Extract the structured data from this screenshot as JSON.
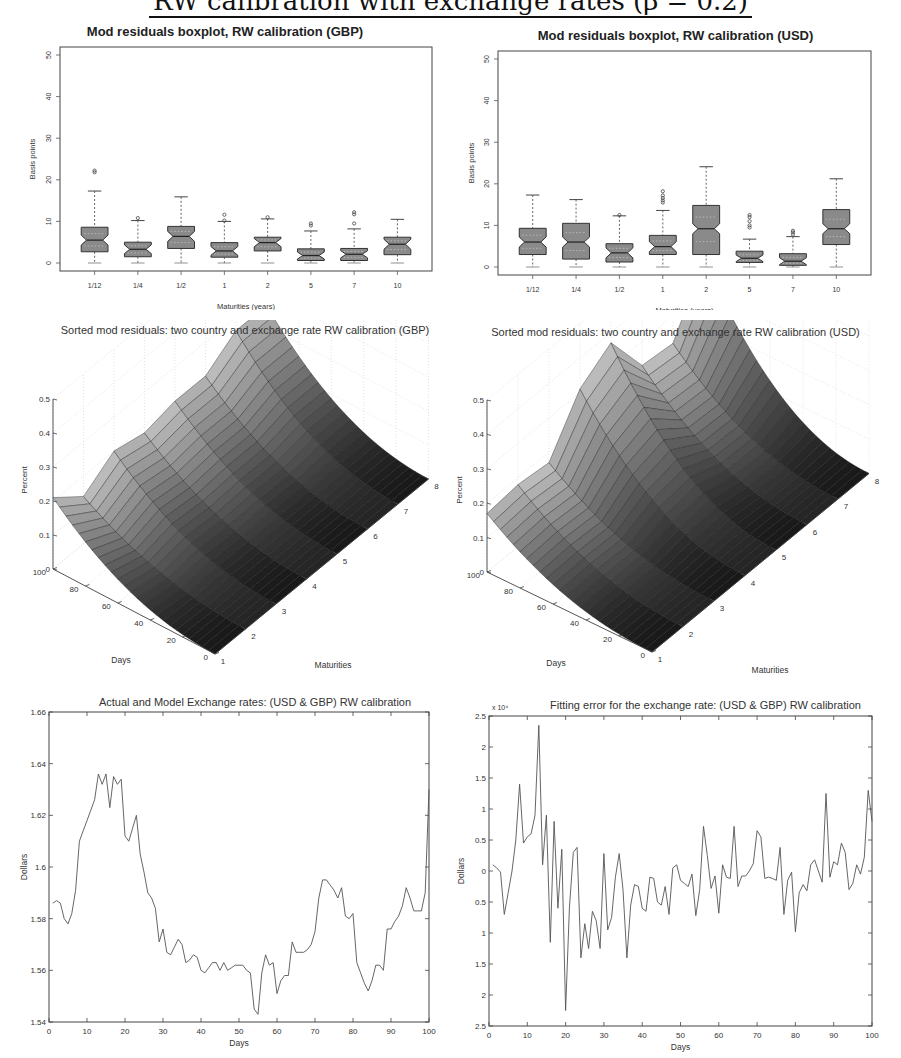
{
  "page": {
    "heading": "RW calibration with exchange rates (β = 0.2)"
  },
  "chart_data": [
    {
      "id": "gbp_boxplot",
      "type": "boxplot",
      "title": "Mod residuals boxplot, RW calibration (GBP)",
      "xlabel": "Maturities (years)",
      "ylabel": "Basis points",
      "ylim": [
        0,
        50
      ],
      "yticks": [
        0,
        10,
        20,
        30,
        40,
        50
      ],
      "categories": [
        "1/12",
        "1/4",
        "1/2",
        "1",
        "2",
        "5",
        "7",
        "10"
      ],
      "boxes": [
        {
          "whisker_low": 0,
          "q1": 2.7,
          "median": 5.5,
          "q3": 8.6,
          "whisker_high": 17.3,
          "outliers": [
            21.8,
            22.2
          ]
        },
        {
          "whisker_low": 0,
          "q1": 1.5,
          "median": 3.3,
          "q3": 5.0,
          "whisker_high": 10.2,
          "outliers": [
            10.8
          ]
        },
        {
          "whisker_low": 0,
          "q1": 3.5,
          "median": 6.4,
          "q3": 8.8,
          "whisker_high": 15.9,
          "outliers": []
        },
        {
          "whisker_low": 0,
          "q1": 1.4,
          "median": 2.9,
          "q3": 4.9,
          "whisker_high": 10.0,
          "outliers": [
            10.2,
            11.6
          ]
        },
        {
          "whisker_low": 0,
          "q1": 2.9,
          "median": 4.9,
          "q3": 6.2,
          "whisker_high": 10.6,
          "outliers": [
            11.0
          ]
        },
        {
          "whisker_low": 0,
          "q1": 0.6,
          "median": 1.8,
          "q3": 3.4,
          "whisker_high": 7.7,
          "outliers": [
            9.0,
            9.5
          ]
        },
        {
          "whisker_low": 0,
          "q1": 0.6,
          "median": 2.1,
          "q3": 3.5,
          "whisker_high": 8.2,
          "outliers": [
            9.5,
            11.7,
            12.2
          ]
        },
        {
          "whisker_low": 0,
          "q1": 2.0,
          "median": 4.5,
          "q3": 6.2,
          "whisker_high": 10.5,
          "outliers": []
        }
      ],
      "grid": false
    },
    {
      "id": "usd_boxplot",
      "type": "boxplot",
      "title": "Mod residuals boxplot, RW calibration (USD)",
      "xlabel": "Maturities (years)",
      "ylabel": "Basis points",
      "ylim": [
        0,
        50
      ],
      "yticks": [
        0,
        10,
        20,
        30,
        40,
        50
      ],
      "categories": [
        "1/12",
        "1/4",
        "1/2",
        "1",
        "2",
        "5",
        "7",
        "10"
      ],
      "boxes": [
        {
          "whisker_low": 0,
          "q1": 3.0,
          "median": 6.0,
          "q3": 9.3,
          "whisker_high": 17.3,
          "outliers": []
        },
        {
          "whisker_low": 0,
          "q1": 1.9,
          "median": 6.0,
          "q3": 10.5,
          "whisker_high": 16.2,
          "outliers": []
        },
        {
          "whisker_low": 0,
          "q1": 1.2,
          "median": 3.4,
          "q3": 5.6,
          "whisker_high": 12.3,
          "outliers": [
            12.5
          ]
        },
        {
          "whisker_low": 0,
          "q1": 3.0,
          "median": 4.9,
          "q3": 7.6,
          "whisker_high": 13.6,
          "outliers": [
            15.5,
            16.0,
            16.6,
            17.2,
            18.2
          ]
        },
        {
          "whisker_low": 0,
          "q1": 3.0,
          "median": 9.2,
          "q3": 14.8,
          "whisker_high": 24.1,
          "outliers": []
        },
        {
          "whisker_low": 0,
          "q1": 1.1,
          "median": 2.1,
          "q3": 3.8,
          "whisker_high": 6.7,
          "outliers": [
            9.5,
            10.0,
            11.0,
            12.0,
            12.5
          ]
        },
        {
          "whisker_low": 0,
          "q1": 0.4,
          "median": 1.4,
          "q3": 3.2,
          "whisker_high": 7.3,
          "outliers": [
            7.8,
            8.3,
            8.7
          ]
        },
        {
          "whisker_low": 0,
          "q1": 5.4,
          "median": 9.2,
          "q3": 13.8,
          "whisker_high": 21.2,
          "outliers": []
        }
      ],
      "grid": false
    },
    {
      "id": "gbp_surface",
      "type": "surface3d",
      "title": "Sorted mod residuals: two country and exchange rate RW calibration (GBP)",
      "xlabel": "Maturities",
      "ylabel": "Days",
      "zlabel": "Percent",
      "xticks": [
        1,
        2,
        3,
        4,
        5,
        6,
        7,
        8
      ],
      "yticks": [
        0,
        20,
        40,
        60,
        80,
        100
      ],
      "zticks": [
        0,
        0.1,
        0.2,
        0.3,
        0.4,
        0.5
      ],
      "zlim": [
        0,
        0.5
      ],
      "peak_by_maturity": [
        0.21,
        0.14,
        0.2,
        0.18,
        0.2,
        0.2,
        0.26,
        0.26
      ],
      "grid": true
    },
    {
      "id": "usd_surface",
      "type": "surface3d",
      "title": "Sorted mod residuals: two country and exchange rate RW calibration (USD)",
      "xlabel": "Maturities",
      "ylabel": "Days",
      "zlabel": "Percent",
      "xticks": [
        1,
        2,
        3,
        4,
        5,
        6,
        7,
        8
      ],
      "yticks": [
        0,
        20,
        40,
        60,
        80,
        100
      ],
      "zticks": [
        0,
        0.1,
        0.2,
        0.3,
        0.4,
        0.5
      ],
      "zlim": [
        0,
        0.5
      ],
      "peak_by_maturity": [
        0.17,
        0.18,
        0.17,
        0.31,
        0.37,
        0.23,
        0.22,
        0.39
      ],
      "grid": true
    },
    {
      "id": "fx_rates",
      "type": "line",
      "title": "Actual and Model Exchange rates: (USD & GBP) RW calibration",
      "xlabel": "Days",
      "ylabel": "Dollars",
      "xlim": [
        0,
        100
      ],
      "ylim": [
        1.54,
        1.66
      ],
      "xticks": [
        0,
        10,
        20,
        30,
        40,
        50,
        60,
        70,
        80,
        90,
        100
      ],
      "yticks": [
        1.54,
        1.56,
        1.58,
        1.6,
        1.62,
        1.64,
        1.66
      ],
      "ytick_labels": [
        "1.54",
        "1.56",
        "1.58",
        "1.6",
        "1.62",
        "1.64",
        "1.66"
      ],
      "x": [
        1,
        2,
        3,
        4,
        5,
        6,
        7,
        8,
        9,
        10,
        11,
        12,
        13,
        14,
        15,
        16,
        17,
        18,
        19,
        20,
        21,
        22,
        23,
        24,
        25,
        26,
        27,
        28,
        29,
        30,
        31,
        32,
        33,
        34,
        35,
        36,
        37,
        38,
        39,
        40,
        41,
        42,
        43,
        44,
        45,
        46,
        47,
        48,
        49,
        50,
        51,
        52,
        53,
        54,
        55,
        56,
        57,
        58,
        59,
        60,
        61,
        62,
        63,
        64,
        65,
        66,
        67,
        68,
        69,
        70,
        71,
        72,
        73,
        74,
        75,
        76,
        77,
        78,
        79,
        80,
        81,
        82,
        83,
        84,
        85,
        86,
        87,
        88,
        89,
        90,
        91,
        92,
        93,
        94,
        95,
        96,
        97,
        98,
        99,
        100
      ],
      "series": [
        {
          "name": "Exchange rate",
          "values": [
            1.586,
            1.587,
            1.586,
            1.58,
            1.578,
            1.582,
            1.591,
            1.61,
            1.614,
            1.618,
            1.622,
            1.626,
            1.636,
            1.632,
            1.636,
            1.623,
            1.635,
            1.632,
            1.634,
            1.612,
            1.61,
            1.615,
            1.62,
            1.605,
            1.598,
            1.59,
            1.588,
            1.584,
            1.571,
            1.576,
            1.567,
            1.566,
            1.569,
            1.572,
            1.57,
            1.563,
            1.564,
            1.566,
            1.565,
            1.56,
            1.559,
            1.561,
            1.563,
            1.563,
            1.56,
            1.563,
            1.56,
            1.561,
            1.562,
            1.562,
            1.562,
            1.56,
            1.559,
            1.545,
            1.543,
            1.559,
            1.566,
            1.562,
            1.563,
            1.551,
            1.556,
            1.558,
            1.558,
            1.571,
            1.567,
            1.567,
            1.567,
            1.568,
            1.57,
            1.575,
            1.588,
            1.595,
            1.595,
            1.593,
            1.591,
            1.588,
            1.592,
            1.581,
            1.58,
            1.582,
            1.563,
            1.559,
            1.555,
            1.552,
            1.556,
            1.562,
            1.562,
            1.56,
            1.576,
            1.576,
            1.579,
            1.581,
            1.585,
            1.592,
            1.588,
            1.583,
            1.583,
            1.583,
            1.59,
            1.63
          ]
        }
      ],
      "grid": false
    },
    {
      "id": "fx_error",
      "type": "line",
      "title": "Fitting error for the exchange rate: (USD & GBP) RW calibration",
      "xlabel": "Days",
      "ylabel": "Dollars",
      "scale_label": "x 10⁴",
      "xlim": [
        0,
        100
      ],
      "ylim": [
        -2.5,
        2.5
      ],
      "xticks": [
        0,
        10,
        20,
        30,
        40,
        50,
        60,
        70,
        80,
        90,
        100
      ],
      "yticks": [
        2.5,
        2,
        1.5,
        1,
        0.5,
        0,
        -0.5,
        -1,
        -1.5,
        -2,
        -2.5
      ],
      "ytick_labels": [
        "2.5",
        "2",
        "1.5",
        "1",
        "0.5",
        "0",
        "0.5",
        "1",
        "1.5",
        "2",
        "2.5"
      ],
      "x": [
        1,
        2,
        3,
        4,
        5,
        6,
        7,
        8,
        9,
        10,
        11,
        12,
        13,
        14,
        15,
        16,
        17,
        18,
        19,
        20,
        21,
        22,
        23,
        24,
        25,
        26,
        27,
        28,
        29,
        30,
        31,
        32,
        33,
        34,
        35,
        36,
        37,
        38,
        39,
        40,
        41,
        42,
        43,
        44,
        45,
        46,
        47,
        48,
        49,
        50,
        51,
        52,
        53,
        54,
        55,
        56,
        57,
        58,
        59,
        60,
        61,
        62,
        63,
        64,
        65,
        66,
        67,
        68,
        69,
        70,
        71,
        72,
        73,
        74,
        75,
        76,
        77,
        78,
        79,
        80,
        81,
        82,
        83,
        84,
        85,
        86,
        87,
        88,
        89,
        90,
        91,
        92,
        93,
        94,
        95,
        96,
        97,
        98,
        99,
        100
      ],
      "series": [
        {
          "name": "Fitting error (x1e-4)",
          "values": [
            0.1,
            0.05,
            -0.02,
            -0.7,
            -0.35,
            0.0,
            0.5,
            1.4,
            0.45,
            0.55,
            0.6,
            0.9,
            2.35,
            0.1,
            0.9,
            -1.15,
            0.8,
            -0.6,
            0.35,
            -2.25,
            -0.6,
            0.3,
            0.38,
            -1.4,
            -0.85,
            -1.25,
            -0.65,
            -0.8,
            -1.25,
            0.28,
            -0.95,
            -0.75,
            -0.1,
            0.28,
            -0.3,
            -1.4,
            -0.55,
            -0.22,
            -0.25,
            -0.6,
            -0.65,
            -0.1,
            -0.12,
            -0.5,
            -0.55,
            -0.25,
            -0.7,
            0.05,
            0.1,
            -0.15,
            -0.2,
            -0.25,
            -0.05,
            -0.72,
            -0.3,
            0.72,
            0.25,
            -0.28,
            -0.08,
            -0.68,
            0.1,
            -0.1,
            -0.12,
            0.72,
            -0.25,
            -0.08,
            -0.08,
            0.0,
            0.12,
            0.65,
            0.55,
            -0.12,
            -0.1,
            -0.12,
            -0.15,
            0.38,
            -0.7,
            -0.15,
            -0.02,
            -0.98,
            -0.35,
            -0.22,
            -0.32,
            0.1,
            0.18,
            0.0,
            -0.18,
            1.25,
            -0.1,
            0.15,
            0.1,
            0.45,
            0.3,
            -0.3,
            -0.2,
            0.1,
            -0.05,
            0.22,
            1.3,
            0.8
          ]
        }
      ],
      "grid": false
    }
  ]
}
